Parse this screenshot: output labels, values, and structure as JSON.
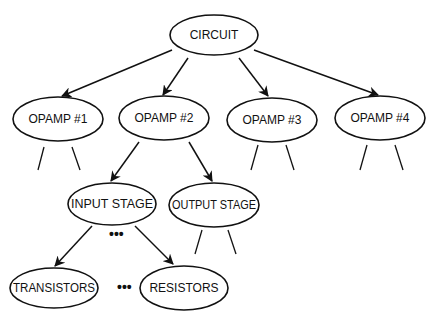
{
  "diagram": {
    "type": "hierarchy-tree",
    "nodes": [
      {
        "id": "circuit",
        "label": "CIRCUIT",
        "cx": 214,
        "cy": 35,
        "rx": 44,
        "ry": 20
      },
      {
        "id": "opamp1",
        "label": "OPAMP #1",
        "cx": 58,
        "cy": 119,
        "rx": 45,
        "ry": 22
      },
      {
        "id": "opamp2",
        "label": "OPAMP #2",
        "cx": 164,
        "cy": 118,
        "rx": 45,
        "ry": 22
      },
      {
        "id": "opamp3",
        "label": "OPAMP #3",
        "cx": 272,
        "cy": 120,
        "rx": 45,
        "ry": 22
      },
      {
        "id": "opamp4",
        "label": "OPAMP #4",
        "cx": 380,
        "cy": 118,
        "rx": 45,
        "ry": 22
      },
      {
        "id": "input_stage",
        "label": "INPUT STAGE",
        "cx": 112,
        "cy": 204,
        "rx": 44,
        "ry": 21
      },
      {
        "id": "output_stage",
        "label": "OUTPUT STAGE",
        "cx": 214,
        "cy": 205,
        "rx": 45,
        "ry": 22
      },
      {
        "id": "transistors",
        "label": "TRANSISTORS",
        "cx": 54,
        "cy": 288,
        "rx": 44,
        "ry": 20
      },
      {
        "id": "resistors",
        "label": "RESISTORS",
        "cx": 184,
        "cy": 288,
        "rx": 44,
        "ry": 22
      }
    ],
    "edges": [
      {
        "from": "circuit",
        "to": "opamp1",
        "x1": 172,
        "y1": 50,
        "x2": 62,
        "y2": 96
      },
      {
        "from": "circuit",
        "to": "opamp2",
        "x1": 188,
        "y1": 58,
        "x2": 163,
        "y2": 95
      },
      {
        "from": "circuit",
        "to": "opamp3",
        "x1": 239,
        "y1": 58,
        "x2": 268,
        "y2": 96
      },
      {
        "from": "circuit",
        "to": "opamp4",
        "x1": 254,
        "y1": 50,
        "x2": 378,
        "y2": 95
      },
      {
        "from": "opamp2",
        "to": "input_stage",
        "x1": 139,
        "y1": 142,
        "x2": 111,
        "y2": 181
      },
      {
        "from": "opamp2",
        "to": "output_stage",
        "x1": 189,
        "y1": 142,
        "x2": 212,
        "y2": 181
      },
      {
        "from": "input_stage",
        "to": "transistors",
        "x1": 92,
        "y1": 226,
        "x2": 55,
        "y2": 266
      },
      {
        "from": "input_stage",
        "to": "resistors",
        "x1": 135,
        "y1": 226,
        "x2": 173,
        "y2": 264
      }
    ],
    "stubs": [
      {
        "parent": "opamp1",
        "lines": [
          [
            44,
            147,
            38,
            170
          ],
          [
            72,
            147,
            80,
            170
          ]
        ]
      },
      {
        "parent": "opamp3",
        "lines": [
          [
            258,
            145,
            251,
            170
          ],
          [
            286,
            145,
            294,
            170
          ]
        ]
      },
      {
        "parent": "opamp4",
        "lines": [
          [
            367,
            145,
            360,
            170
          ],
          [
            395,
            145,
            403,
            170
          ]
        ]
      },
      {
        "parent": "output_stage",
        "lines": [
          [
            202,
            230,
            195,
            254
          ],
          [
            228,
            230,
            236,
            254
          ]
        ]
      }
    ],
    "ellipsis_markers": [
      {
        "between": "input_stage-children",
        "text": "•••",
        "x": 109,
        "y": 239
      },
      {
        "between": "transistors-resistors",
        "text": "•••",
        "x": 117,
        "y": 292
      }
    ]
  }
}
